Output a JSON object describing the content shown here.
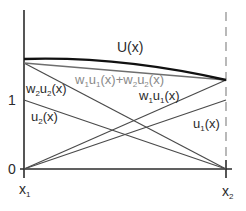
{
  "diagram": {
    "type": "line-plot-schematic",
    "axes": {
      "y_ticks": [
        "0",
        "1"
      ],
      "x_ticks": {
        "left": "x",
        "left_sub": "1",
        "right": "x",
        "right_sub": "2"
      }
    },
    "labels": {
      "U": "U(x)",
      "sum": {
        "w1": "w",
        "w1s": "1",
        "u1": "u",
        "u1s": "1",
        "mid": "(x)+w",
        "w2s": "2",
        "u2": "u",
        "u2s": "2",
        "end": "(x)"
      },
      "w2u2": {
        "w": "w",
        "ws": "2",
        "u": "u",
        "us": "2",
        "end": "(x)"
      },
      "w1u1": {
        "w": "w",
        "ws": "1",
        "u": "u",
        "us": "1",
        "end": "(x)"
      },
      "u2": {
        "u": "u",
        "us": "2",
        "end": "(x)"
      },
      "u1": {
        "u": "u",
        "us": "1",
        "end": "(x)"
      }
    },
    "colors": {
      "axis": "#2b2b2b",
      "curve": "#111111",
      "lines": "#4a4a4a",
      "sum": "#7a7a7a",
      "dashed": "#8a8a8a"
    },
    "lines": [
      {
        "name": "w2u2",
        "from": [
          0,
          1.54
        ],
        "to": [
          1,
          0
        ]
      },
      {
        "name": "u2",
        "from": [
          0,
          1
        ],
        "to": [
          1,
          0
        ]
      },
      {
        "name": "w1u1",
        "from": [
          0,
          0
        ],
        "to": [
          1,
          1.29
        ]
      },
      {
        "name": "u1",
        "from": [
          0,
          0
        ],
        "to": [
          1,
          1
        ]
      },
      {
        "name": "w1u1+w2u2",
        "from": [
          0,
          1.54
        ],
        "to": [
          1,
          1.29
        ]
      },
      {
        "name": "U",
        "from": [
          0,
          1.59
        ],
        "to": [
          1,
          1.29
        ],
        "shape": "concave"
      }
    ]
  }
}
